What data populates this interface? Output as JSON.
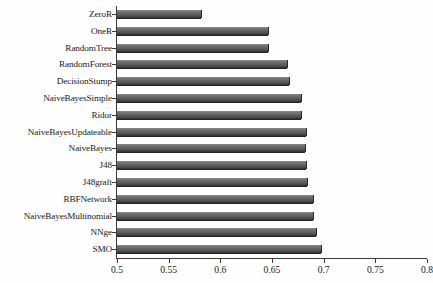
{
  "chart_data": {
    "type": "bar",
    "orientation": "horizontal",
    "title": "",
    "xlabel": "",
    "ylabel": "",
    "xlim": [
      0.5,
      0.8
    ],
    "xticks": [
      0.5,
      0.55,
      0.6,
      0.65,
      0.7,
      0.75,
      0.8
    ],
    "xtick_labels": [
      "0.5",
      "0.55",
      "0.6",
      "0.65",
      "0.7",
      "0.75",
      "0.8"
    ],
    "grid": false,
    "legend": null,
    "categories": [
      "ZeroR",
      "OneR",
      "RandomTree",
      "RandomForest",
      "DecisionStump",
      "NaiveBayesSimple",
      "Ridor",
      "NaiveBayesUpdateable",
      "NaiveBayes",
      "J48",
      "J48graft",
      "RBFNetwork",
      "NaiveBayesMultinomial",
      "NNge",
      "SMO"
    ],
    "values": [
      0.582,
      0.647,
      0.647,
      0.665,
      0.667,
      0.679,
      0.679,
      0.684,
      0.683,
      0.684,
      0.685,
      0.691,
      0.691,
      0.694,
      0.698
    ],
    "bar_color": "#5d5d5d",
    "axis_color": "#3b3b3b",
    "background_color": "#fefefe"
  }
}
